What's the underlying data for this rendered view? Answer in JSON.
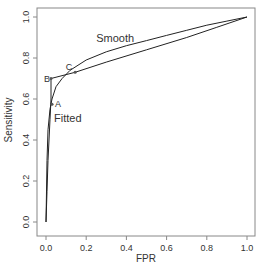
{
  "chart_data": {
    "type": "line",
    "title": "",
    "xlabel": "FPR",
    "ylabel": "Sensitivity",
    "xlim": [
      0,
      1
    ],
    "ylim": [
      0,
      1
    ],
    "xticks": [
      "0.0",
      "0.2",
      "0.4",
      "0.6",
      "0.8",
      "1.0"
    ],
    "yticks": [
      "0.0",
      "0.2",
      "0.4",
      "0.6",
      "0.8",
      "1.0"
    ],
    "grid": false,
    "series": [
      {
        "name": "Smooth",
        "label": "Smooth",
        "x": [
          0.0,
          0.005,
          0.01,
          0.02,
          0.03,
          0.05,
          0.08,
          0.12,
          0.2,
          0.3,
          0.4,
          0.5,
          0.6,
          0.7,
          0.8,
          0.9,
          1.0
        ],
        "y": [
          0.0,
          0.3,
          0.45,
          0.55,
          0.6,
          0.66,
          0.7,
          0.74,
          0.79,
          0.83,
          0.86,
          0.885,
          0.91,
          0.935,
          0.96,
          0.98,
          1.0
        ]
      },
      {
        "name": "Fitted",
        "label": "Fitted",
        "x": [
          0.0,
          0.005,
          0.01,
          0.02,
          0.025,
          0.025,
          0.145,
          0.3,
          0.5,
          0.7,
          0.85,
          1.0
        ],
        "y": [
          0.0,
          0.15,
          0.3,
          0.5,
          0.6,
          0.7,
          0.73,
          0.78,
          0.84,
          0.9,
          0.95,
          1.0
        ]
      }
    ],
    "points": [
      {
        "label": "A",
        "x": 0.03,
        "y": 0.575
      },
      {
        "label": "B",
        "x": 0.025,
        "y": 0.7
      },
      {
        "label": "C",
        "x": 0.145,
        "y": 0.73
      }
    ],
    "annotations": [
      {
        "text": "Smooth",
        "x": 0.25,
        "y": 0.88
      },
      {
        "text": "Fitted",
        "x": 0.04,
        "y": 0.49
      }
    ]
  }
}
